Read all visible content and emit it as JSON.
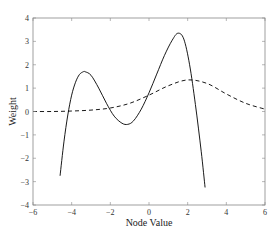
{
  "chart_data": {
    "type": "line",
    "title": "",
    "xlabel": "Node Value",
    "ylabel": "Weight",
    "xlim": [
      -6,
      6
    ],
    "ylim": [
      -4,
      4
    ],
    "xticks": [
      -6,
      -4,
      -2,
      0,
      2,
      4,
      6
    ],
    "yticks": [
      -4,
      -3,
      -2,
      -1,
      0,
      1,
      2,
      3,
      4
    ],
    "grid": false,
    "legend": null,
    "series": [
      {
        "name": "solid",
        "style": "solid",
        "color": "#000000",
        "x": [
          -4.6,
          -4.4,
          -4.2,
          -4.0,
          -3.8,
          -3.6,
          -3.4,
          -3.3,
          -3.0,
          -2.6,
          -2.2,
          -1.8,
          -1.4,
          -1.1,
          -0.8,
          -0.4,
          0.0,
          0.4,
          0.8,
          1.2,
          1.5,
          1.8,
          2.1,
          2.4,
          2.7,
          2.9
        ],
        "y": [
          -2.75,
          -1.3,
          -0.15,
          0.7,
          1.25,
          1.58,
          1.7,
          1.7,
          1.55,
          1.0,
          0.35,
          -0.2,
          -0.5,
          -0.55,
          -0.4,
          0.1,
          0.8,
          1.6,
          2.4,
          3.05,
          3.35,
          3.1,
          2.0,
          0.3,
          -1.7,
          -3.25
        ]
      },
      {
        "name": "dashed",
        "style": "dashed",
        "color": "#000000",
        "x": [
          -6,
          -5,
          -4,
          -3,
          -2,
          -1,
          0,
          1,
          2,
          3,
          4,
          5,
          6
        ],
        "y": [
          0.0,
          0.0,
          0.02,
          0.06,
          0.15,
          0.35,
          0.7,
          1.1,
          1.35,
          1.2,
          0.75,
          0.35,
          0.1
        ]
      }
    ]
  }
}
